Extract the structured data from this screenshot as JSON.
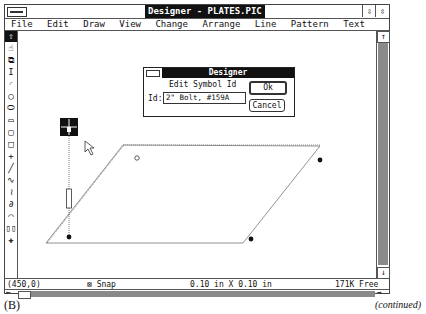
{
  "window": {
    "title": "Designer - PLATES.PIC",
    "minimize_icon": "down-arrow",
    "maximize_icon": "restore-arrows"
  },
  "menu": {
    "items": [
      {
        "label": "File"
      },
      {
        "label": "Edit"
      },
      {
        "label": "Draw"
      },
      {
        "label": "View"
      },
      {
        "label": "Change"
      },
      {
        "label": "Arrange"
      },
      {
        "label": "Line"
      },
      {
        "label": "Pattern"
      },
      {
        "label": "Text"
      }
    ]
  },
  "toolbox": {
    "tools": [
      {
        "name": "select-arrow",
        "glyph": "⇧"
      },
      {
        "name": "hand",
        "glyph": "☝"
      },
      {
        "name": "zoom-box",
        "glyph": "⧉"
      },
      {
        "name": "text",
        "glyph": "I"
      },
      {
        "name": "arc",
        "glyph": "◜"
      },
      {
        "name": "circle",
        "glyph": "○"
      },
      {
        "name": "ellipse",
        "glyph": "⬭"
      },
      {
        "name": "rectangle",
        "glyph": "▭"
      },
      {
        "name": "rounded-rectangle",
        "glyph": "▢"
      },
      {
        "name": "square",
        "glyph": "□"
      },
      {
        "name": "cross-line",
        "glyph": "+"
      },
      {
        "name": "line",
        "glyph": "╱"
      },
      {
        "name": "curve",
        "glyph": "∿"
      },
      {
        "name": "freehand-curve",
        "glyph": "≀"
      },
      {
        "name": "freehand",
        "glyph": "∂"
      },
      {
        "name": "polygon",
        "glyph": "⌒"
      },
      {
        "name": "columns",
        "glyph": "▯▯"
      },
      {
        "name": "symbol",
        "glyph": "✚"
      }
    ]
  },
  "dialog": {
    "title": "Designer",
    "heading": "Edit Symbol Id",
    "id_label": "Id:",
    "id_value": "2\" Bolt, #159A",
    "ok_label": "Ok",
    "cancel_label": "Cancel"
  },
  "status": {
    "coordinates": "(450,0)",
    "snap_label": "Snap",
    "grid": "0.10 in X 0.10 in",
    "memory": "171K Free"
  },
  "caption": {
    "label": "(B)",
    "note": "(continued)"
  }
}
